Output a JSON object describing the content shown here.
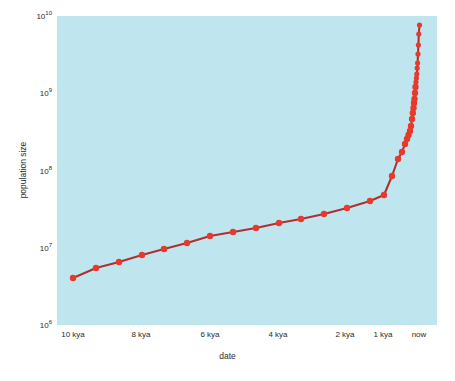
{
  "chart_data": {
    "type": "line",
    "title": "",
    "xlabel": "date",
    "ylabel": "population size",
    "yscale": "log",
    "ylim": [
      1000000,
      10000000000
    ],
    "ytick_labels": [
      "10¹⁰",
      "10⁹",
      "10⁸",
      "10⁷",
      "10⁶"
    ],
    "ytick_values": [
      10000000000,
      1000000000,
      100000000,
      10000000,
      1000000
    ],
    "xtick_labels": [
      "10 kya",
      "8 kya",
      "6 kya",
      "4 kya",
      "2 kya",
      "1 kya",
      "now"
    ],
    "xtick_values": [
      10000,
      8000,
      6000,
      4000,
      2000,
      1000,
      0
    ],
    "grid": false,
    "legend": null,
    "marker_color": "#e8392a",
    "line_color": "#b03030",
    "plot_background": "#bfe6ef",
    "figure_background": "#ffffff",
    "series": [
      {
        "name": "world population",
        "x": [
          10000,
          9500,
          9000,
          8500,
          8000,
          7500,
          7000,
          6500,
          6000,
          5500,
          5000,
          4500,
          4000,
          3500,
          3000,
          2500,
          2000,
          1500,
          1000,
          800,
          700,
          500,
          400,
          300,
          250,
          200,
          170,
          150,
          130,
          110,
          90,
          75,
          60,
          50,
          40,
          30,
          20,
          10,
          0
        ],
        "y": [
          5000000,
          6200000,
          7200000,
          8400000,
          10000000,
          12000000,
          15000000,
          17000000,
          19000000,
          22000000,
          25000000,
          29000000,
          35000000,
          42000000,
          50000000,
          100000000,
          200000000,
          255000000,
          320000000,
          360000000,
          400000000,
          440000000,
          500000000,
          600000000,
          700000000,
          800000000,
          900000000,
          1000000000,
          1200000000,
          1450000000,
          1650000000,
          1800000000,
          2000000000,
          2300000000,
          2600000000,
          3200000000,
          4000000000,
          5200000000,
          7000000000
        ],
        "x_pixels": [
          73,
          96,
          119,
          142,
          164,
          187,
          210,
          233,
          256,
          279,
          301,
          324,
          347,
          370,
          384,
          392,
          398,
          402,
          405,
          407,
          408.5,
          410,
          411,
          412,
          412.8,
          413.5,
          414,
          414.5,
          415,
          415.5,
          416,
          416.4,
          416.8,
          417.2,
          417.6,
          418,
          418.4,
          418.8,
          419.5
        ],
        "y_pixels": [
          278,
          268,
          262,
          255,
          249,
          243,
          236,
          232,
          228,
          223,
          219,
          214,
          208,
          201,
          195,
          176,
          159,
          152,
          144,
          139,
          135,
          131,
          126,
          119,
          113,
          108,
          103,
          99,
          93,
          87,
          82,
          78,
          74,
          68,
          63,
          54,
          45,
          34,
          25
        ]
      }
    ]
  },
  "axes": {
    "ylabel_text": "population size",
    "xlabel_text": "date"
  }
}
